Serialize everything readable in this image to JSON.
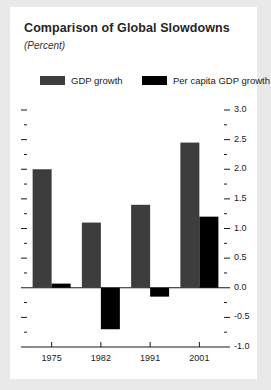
{
  "figure": {
    "title": "Comparison of Global Slowdowns",
    "subtitle": "(Percent)"
  },
  "colors": {
    "background": "#e9e9e9",
    "panel": "#ffffff",
    "gdp_growth": "#3d3d3d",
    "per_capita_gdp_growth": "#000000",
    "axis": "#1a1a1a",
    "text": "#1a1a1a"
  },
  "chart_data": {
    "type": "bar",
    "title": "Comparison of Global Slowdowns",
    "subtitle": "(Percent)",
    "xlabel": "",
    "ylabel": "",
    "categories": [
      "1975",
      "1982",
      "1991",
      "2001"
    ],
    "series": [
      {
        "name": "GDP growth",
        "color": "#3d3d3d",
        "values": [
          2.0,
          1.1,
          1.4,
          2.45
        ]
      },
      {
        "name": "Per capita GDP growth",
        "color": "#000000",
        "values": [
          0.07,
          -0.7,
          -0.15,
          1.2
        ]
      }
    ],
    "ylim": [
      -1.0,
      3.0
    ],
    "ytick_major": [
      "3.0",
      "2.5",
      "2.0",
      "1.5",
      "1.0",
      "0.5",
      "0.0",
      "-0.5",
      "-1.0"
    ],
    "ytick_major_values": [
      3.0,
      2.5,
      2.0,
      1.5,
      1.0,
      0.5,
      0.0,
      -0.5,
      -1.0
    ],
    "ytick_minor_values": [
      2.75,
      2.25,
      1.75,
      1.25,
      0.75,
      0.25,
      -0.25,
      -0.75
    ],
    "ytick_position": "right",
    "grid": false,
    "legend_position": "top",
    "legend": [
      "GDP growth",
      "Per capita GDP growth"
    ]
  }
}
